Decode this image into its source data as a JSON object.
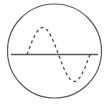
{
  "figure": {
    "title": "Sine wave inscribed in circle",
    "type": "geometric-diagram",
    "background_color": "#ffffff",
    "canvas": {
      "width": 109,
      "height": 108
    }
  },
  "elements": {
    "circle": {
      "name": "outer-circle",
      "center_x": 54.5,
      "center_y": 51,
      "radius": 47,
      "stroke_color": "#5a5a5a",
      "stroke_width": 1.2,
      "fill": "none",
      "style": "solid"
    },
    "axis_line": {
      "name": "horizontal-axis-line",
      "x1": 11,
      "y1": 54.5,
      "x2": 98,
      "y2": 54.5,
      "stroke_color": "#5a5a5a",
      "stroke_width": 1.3,
      "style": "solid"
    },
    "sine_wave": {
      "name": "dashed-sine-wave",
      "stroke_color": "#4a4a4a",
      "stroke_width": 1.3,
      "style": "dashed",
      "dash_pattern": "3,3",
      "x_start": 27,
      "x_end": 90,
      "baseline_y": 54.5,
      "amplitude": 27,
      "periods": 1,
      "phase": "crest-first",
      "crest_x": 44,
      "crest_y": 27,
      "zero_crossing_x": 58,
      "trough_x": 74,
      "trough_y": 82
    }
  },
  "chart_data": {
    "type": "line",
    "title": "Sine wave inscribed in circle",
    "xlabel": "",
    "ylabel": "",
    "xlim": [
      0,
      360
    ],
    "ylim": [
      -1,
      1
    ],
    "grid": false,
    "legend": false,
    "series": [
      {
        "name": "sine",
        "style": "dashed",
        "color": "#4a4a4a",
        "x": [
          0,
          15,
          30,
          45,
          60,
          75,
          90,
          105,
          120,
          135,
          150,
          165,
          180,
          195,
          210,
          225,
          240,
          255,
          270,
          285,
          300,
          315,
          330,
          345,
          360
        ],
        "values": [
          0,
          0.259,
          0.5,
          0.707,
          0.866,
          0.966,
          1,
          0.966,
          0.866,
          0.707,
          0.5,
          0.259,
          0,
          -0.259,
          -0.5,
          -0.707,
          -0.866,
          -0.966,
          -1,
          -0.966,
          -0.866,
          -0.707,
          -0.5,
          -0.259,
          0
        ]
      },
      {
        "name": "axis",
        "style": "solid",
        "color": "#5a5a5a",
        "x": [
          0,
          360
        ],
        "values": [
          0,
          0
        ]
      }
    ]
  }
}
